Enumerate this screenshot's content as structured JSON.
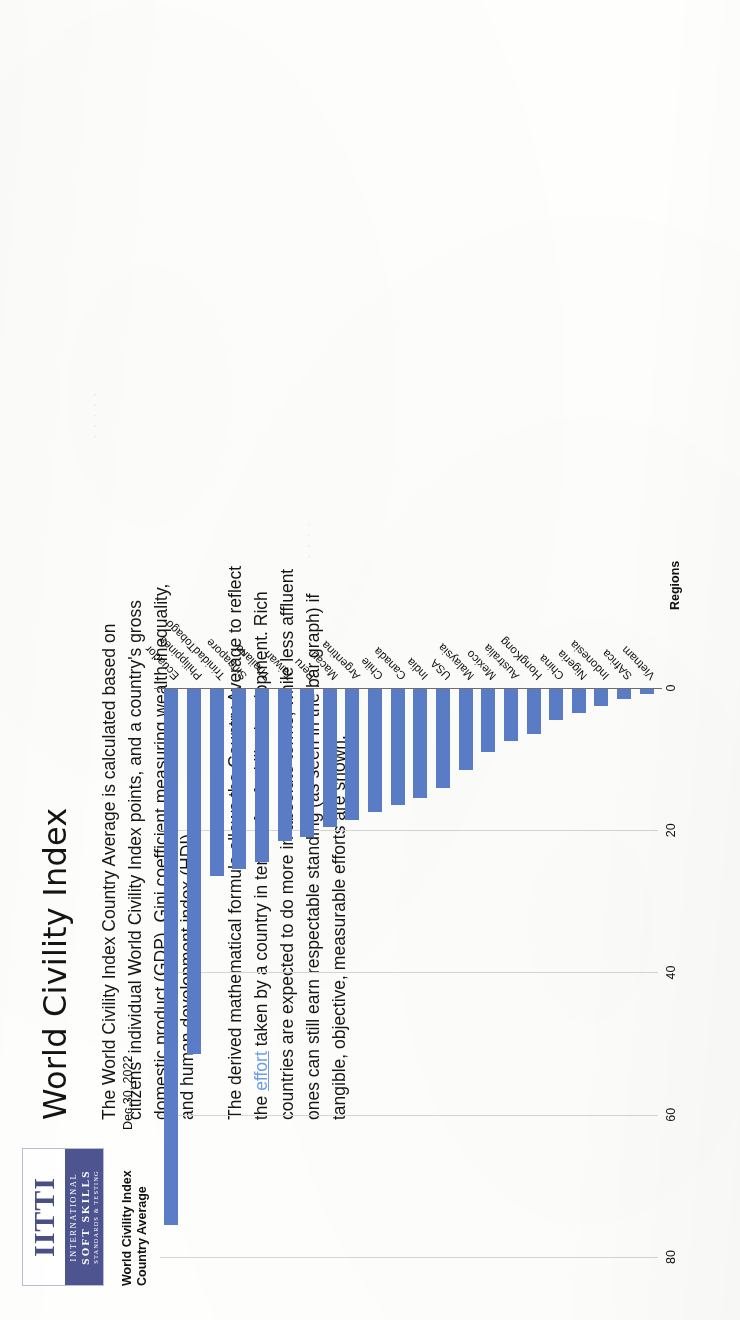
{
  "document": {
    "headline": "World Civility Index",
    "logo": {
      "wordmark": "IITTI",
      "line1": "INTERNATIONAL",
      "line2": "SOFT SKILLS",
      "line3": "STANDARDS & TESTING",
      "brand_color": "#4e5490"
    },
    "paragraphs": [
      {
        "before_link": "The World Civility Index Country Average is calculated based on citizens' individual World Civility Index points, and a country's gross domestic product (GDP), Gini coefficient measuring wealth inequality, and human development index (HDI).",
        "link": "",
        "after_link": ""
      },
      {
        "before_link": "The derived mathematical formula allows the Country Average to reflect the ",
        "link": "effort",
        "after_link": " taken by a country in terms of soft skills development.  Rich countries are expected to do more in absolute terms, while less affluent ones can still earn respectable standing (as seen in the bar graph) if tangible, objective, measurable efforts are shown."
      }
    ]
  },
  "chart_data": {
    "type": "bar",
    "orientation": "horizontal",
    "title": "World Civility Index\nCountry Average",
    "title_line1": "World Civility Index",
    "title_line2": "Country Average",
    "date": "Dec 30, 2022",
    "xlabel": "Regions",
    "ylabel": "",
    "ylim": [
      0,
      80
    ],
    "ticks": [
      0,
      20,
      40,
      60,
      80
    ],
    "grid": true,
    "legend": "none",
    "bar_color": "#5b7dc8",
    "categories": [
      "Ecuador",
      "Philippines",
      "TrinidadTobago",
      "Singapore",
      "Thailand",
      "Taiwan",
      "Peru",
      "Macau",
      "Argentina",
      "Chile",
      "Canada",
      "India",
      "USA",
      "Malaysia",
      "Mexico",
      "Australia",
      "HongKong",
      "China",
      "Nigeria",
      "Indonesia",
      "SAfrica",
      "Vietnam"
    ],
    "values": [
      75.5,
      51.5,
      26.5,
      25.5,
      24.5,
      21.5,
      21.0,
      19.5,
      18.5,
      17.5,
      16.5,
      15.5,
      14.0,
      11.5,
      9.0,
      7.5,
      6.5,
      4.5,
      3.5,
      2.5,
      1.5,
      0.8
    ]
  }
}
